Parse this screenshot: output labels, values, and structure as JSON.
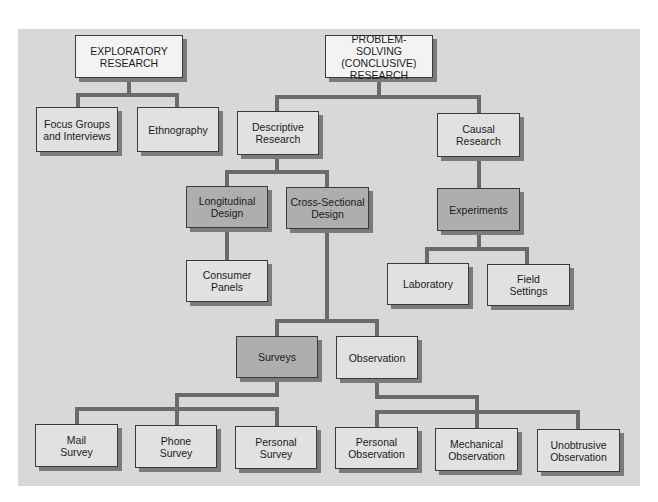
{
  "diagram": {
    "type": "tree",
    "title": "",
    "nodes": {
      "exploratory": "EXPLORATORY\nRESEARCH",
      "problem_solving": "PROBLEM-SOLVING\n(CONCLUSIVE)\nRESEARCH",
      "focus_groups": "Focus Groups\nand Interviews",
      "ethnography": "Ethnography",
      "descriptive": "Descriptive\nResearch",
      "causal": "Causal\nResearch",
      "longitudinal": "Longitudinal\nDesign",
      "cross_sectional": "Cross-Sectional\nDesign",
      "experiments": "Experiments",
      "consumer_panels": "Consumer\nPanels",
      "laboratory": "Laboratory",
      "field_settings": "Field\nSettings",
      "surveys": "Surveys",
      "observation": "Observation",
      "mail_survey": "Mail\nSurvey",
      "phone_survey": "Phone\nSurvey",
      "personal_survey": "Personal\nSurvey",
      "personal_observation": "Personal\nObservation",
      "mechanical_observation": "Mechanical\nObservation",
      "unobtrusive_observation": "Unobtrusive\nObservation"
    },
    "edges": [
      [
        "exploratory",
        "focus_groups"
      ],
      [
        "exploratory",
        "ethnography"
      ],
      [
        "problem_solving",
        "descriptive"
      ],
      [
        "problem_solving",
        "causal"
      ],
      [
        "descriptive",
        "longitudinal"
      ],
      [
        "descriptive",
        "cross_sectional"
      ],
      [
        "causal",
        "experiments"
      ],
      [
        "longitudinal",
        "consumer_panels"
      ],
      [
        "experiments",
        "laboratory"
      ],
      [
        "experiments",
        "field_settings"
      ],
      [
        "cross_sectional",
        "surveys"
      ],
      [
        "cross_sectional",
        "observation"
      ],
      [
        "surveys",
        "mail_survey"
      ],
      [
        "surveys",
        "phone_survey"
      ],
      [
        "surveys",
        "personal_survey"
      ],
      [
        "observation",
        "personal_observation"
      ],
      [
        "observation",
        "mechanical_observation"
      ],
      [
        "observation",
        "unobtrusive_observation"
      ]
    ],
    "colors": {
      "panel": "#d8d8d6",
      "connector": "#6a6a6a",
      "box_white": "#f3f3f3",
      "box_light": "#e1e1e1",
      "box_dark": "#aeaeae"
    }
  }
}
